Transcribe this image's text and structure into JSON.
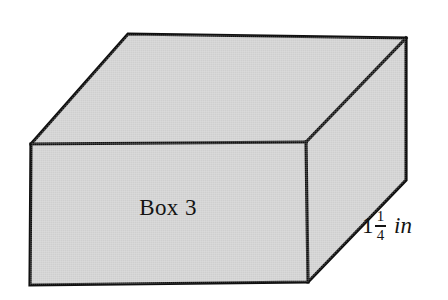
{
  "figure": {
    "type": "3d-rectangular-prism-diagram",
    "subject": "Box 3",
    "face_label": "Box 3",
    "colors": {
      "face_fill": "#cfcfcf",
      "edge_stroke": "#101010",
      "background": "#ffffff",
      "text": "#141414"
    },
    "dimension_labels": [
      {
        "name": "depth",
        "whole": "1",
        "numerator": "1",
        "denominator": "4",
        "unit": "in",
        "full_text": "1 1/4 in"
      }
    ],
    "geometry": {
      "front_face": "31,144 306,142 308,282 30,285",
      "top_face": "31,144 128,34 406,38 306,142",
      "right_face": "306,142 406,38 406,180 308,282"
    }
  }
}
